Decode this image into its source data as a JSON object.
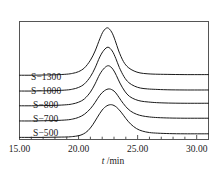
{
  "chart_data": {
    "type": "line",
    "title": "",
    "subtitle": "",
    "xlabel": "t /min",
    "xlabel_italic_part": "t",
    "xlabel_rest": " /min",
    "ylabel": "",
    "xlim": [
      15.0,
      31.0
    ],
    "ylim": [
      0,
      5.6
    ],
    "grid": false,
    "legend_position": "inline-left-of-curves",
    "x_major_ticks": [
      15.0,
      20.0,
      25.0,
      30.0
    ],
    "x_major_tick_labels": [
      "15.00",
      "20.00",
      "25.00",
      "30.00"
    ],
    "x_minor_tick_interval": 1.0,
    "y_axis_visible_ticks": false,
    "axis_color": "#555555",
    "curve_color": "#1a1a1a",
    "background_color": "#ffffff",
    "note": "Stacked GPC/SEC chromatogram traces, each offset vertically; peaks near t = 22.3-22.8 min",
    "series": [
      {
        "name": "S-1300",
        "label": "S−1300",
        "baseline_offset": 3.05,
        "peak_x": 22.45,
        "peak_height": 2.25,
        "left_width": 1.45,
        "right_width": 1.15,
        "x": [
          15.0,
          16.0,
          17.0,
          18.0,
          19.0,
          19.5,
          20.0,
          20.5,
          21.0,
          21.4,
          21.8,
          22.1,
          22.45,
          22.8,
          23.1,
          23.4,
          23.8,
          24.2,
          24.7,
          25.2,
          25.8,
          26.5,
          27.5,
          29.0,
          31.0
        ],
        "y": [
          3.05,
          3.05,
          3.06,
          3.07,
          3.1,
          3.14,
          3.22,
          3.4,
          3.76,
          4.2,
          4.78,
          5.14,
          5.3,
          5.1,
          4.7,
          4.2,
          3.7,
          3.42,
          3.25,
          3.16,
          3.12,
          3.1,
          3.09,
          3.08,
          3.08
        ]
      },
      {
        "name": "S-1000",
        "label": "S−1000",
        "baseline_offset": 2.3,
        "peak_x": 22.5,
        "peak_height": 2.0,
        "left_width": 1.4,
        "right_width": 1.15,
        "x": [
          15.0,
          16.0,
          17.0,
          18.0,
          19.0,
          19.5,
          20.0,
          20.5,
          21.0,
          21.4,
          21.8,
          22.15,
          22.5,
          22.85,
          23.15,
          23.45,
          23.85,
          24.25,
          24.75,
          25.25,
          25.85,
          26.5,
          27.5,
          29.0,
          31.0
        ],
        "y": [
          2.3,
          2.3,
          2.31,
          2.32,
          2.35,
          2.39,
          2.47,
          2.64,
          2.98,
          3.4,
          3.92,
          4.24,
          4.38,
          4.2,
          3.85,
          3.42,
          2.98,
          2.7,
          2.53,
          2.44,
          2.4,
          2.38,
          2.36,
          2.35,
          2.35
        ]
      },
      {
        "name": "S-800",
        "label": "S−800",
        "baseline_offset": 1.6,
        "peak_x": 22.55,
        "peak_height": 1.85,
        "left_width": 1.4,
        "right_width": 1.2,
        "x": [
          15.0,
          16.0,
          17.0,
          18.0,
          19.0,
          19.5,
          20.0,
          20.5,
          21.0,
          21.4,
          21.8,
          22.2,
          22.55,
          22.9,
          23.2,
          23.5,
          23.9,
          24.3,
          24.8,
          25.3,
          25.9,
          26.6,
          27.6,
          29.0,
          31.0
        ],
        "y": [
          1.6,
          1.6,
          1.61,
          1.62,
          1.65,
          1.69,
          1.77,
          1.93,
          2.25,
          2.64,
          3.1,
          3.4,
          3.5,
          3.34,
          3.04,
          2.68,
          2.3,
          2.05,
          1.9,
          1.82,
          1.78,
          1.75,
          1.73,
          1.72,
          1.72
        ]
      },
      {
        "name": "S-700",
        "label": "S−700",
        "baseline_offset": 0.88,
        "peak_x": 22.6,
        "peak_height": 1.38,
        "left_width": 1.5,
        "right_width": 1.35,
        "x": [
          15.0,
          16.0,
          17.0,
          18.0,
          19.0,
          19.5,
          20.0,
          20.5,
          21.0,
          21.4,
          21.8,
          22.2,
          22.6,
          23.0,
          23.3,
          23.6,
          24.0,
          24.4,
          24.9,
          25.4,
          26.0,
          26.7,
          27.7,
          29.0,
          31.0
        ],
        "y": [
          0.88,
          0.88,
          0.89,
          0.9,
          0.93,
          0.97,
          1.05,
          1.2,
          1.46,
          1.76,
          2.1,
          2.32,
          2.4,
          2.3,
          2.1,
          1.85,
          1.56,
          1.35,
          1.2,
          1.12,
          1.07,
          1.04,
          1.02,
          1.01,
          1.01
        ]
      },
      {
        "name": "S-500",
        "label": "S−500",
        "baseline_offset": 0.1,
        "peak_x": 22.8,
        "peak_height": 1.55,
        "left_width": 1.25,
        "right_width": 1.3,
        "x": [
          15.0,
          16.0,
          17.0,
          18.0,
          19.0,
          19.5,
          20.0,
          20.4,
          20.8,
          21.2,
          21.6,
          22.0,
          22.4,
          22.8,
          23.2,
          23.6,
          24.0,
          24.4,
          24.9,
          25.4,
          26.0,
          26.7,
          27.7,
          29.0,
          31.0
        ],
        "y": [
          0.1,
          0.1,
          0.1,
          0.11,
          0.12,
          0.14,
          0.18,
          0.26,
          0.42,
          0.7,
          1.06,
          1.4,
          1.6,
          1.65,
          1.54,
          1.3,
          1.0,
          0.74,
          0.52,
          0.4,
          0.33,
          0.3,
          0.28,
          0.27,
          0.27
        ]
      }
    ]
  },
  "axis": {
    "tick_labels": [
      "15.00",
      "20.00",
      "25.00",
      "30.00"
    ],
    "title_italic": "t",
    "title_rest": " /min"
  },
  "labels": {
    "s1300": "S−1300",
    "s1000": "S−1000",
    "s800": "S−800",
    "s700": "S−700",
    "s500": "S−500"
  }
}
